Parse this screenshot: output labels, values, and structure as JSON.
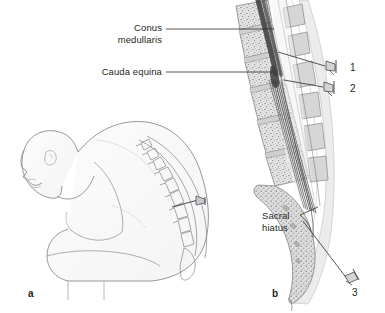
{
  "figure": {
    "background_color": "#ffffff",
    "ink_color": "#231f20",
    "line_color": "#6e6e6e"
  },
  "labels": {
    "conus_medullaris": "Conus\nmedullaris",
    "cauda_equina": "Cauda equina",
    "sacral_hiatus": "Sacral\nhiatus"
  },
  "markers": {
    "needle_1": "1",
    "needle_2": "2",
    "needle_3": "3"
  },
  "panels": {
    "a": "a",
    "b": "b"
  },
  "panel_a": {
    "description": "Line drawing of a seated patient in flexed position with needle inserted in the lumbar spine"
  },
  "panel_b": {
    "description": "Sagittal section of the lumbosacral vertebral column showing spinal cord, conus medullaris, cauda equina and sacral hiatus with three needle positions"
  }
}
